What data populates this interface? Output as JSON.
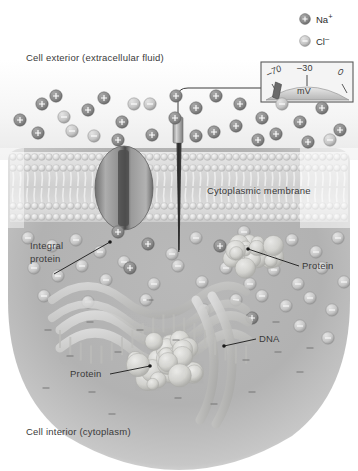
{
  "figure": {
    "exterior_label": "Cell exterior (extracellular fluid)",
    "interior_label": "Cell interior (cytoplasm)"
  },
  "legend": {
    "items": [
      {
        "icon": "plus-circle-icon",
        "symbol": "+",
        "label": "Na",
        "charge": "+",
        "full": "Na+"
      },
      {
        "icon": "minus-circle-icon",
        "symbol": "–",
        "label": "Cl",
        "charge": "–",
        "full": "Cl–"
      }
    ]
  },
  "voltmeter": {
    "name": "voltmeter",
    "unit": "mV",
    "ticks": [
      "–70",
      "–30",
      "0"
    ],
    "needle_value": "–70"
  },
  "labels": {
    "cytoplasmic_membrane": "Cytoplasmic membrane",
    "integral_protein_line1": "Integral",
    "integral_protein_line2": "protein",
    "protein_right": "Protein",
    "protein_lower": "Protein",
    "dna": "DNA"
  },
  "colors": {
    "cation_fill": "#8c8c8c",
    "anion_fill": "#c9c9c9",
    "membrane_head": "#d8d8d8",
    "cytoplasm": "#b4b4b4",
    "exterior": "#ededed",
    "line": "#1a1a1a",
    "protein_channel": "#5a5a5a",
    "biomolecule": "#cfcfc9"
  },
  "chart_data": {
    "type": "diagram",
    "ion_distribution": {
      "exterior_dominant": "Na+ (positive)",
      "interior_dominant": "Cl– (negative)",
      "exterior_cations": 24,
      "exterior_anions": 7,
      "interior_anions": 34,
      "interior_cations": 6,
      "resting_potential_mV": -70
    }
  }
}
